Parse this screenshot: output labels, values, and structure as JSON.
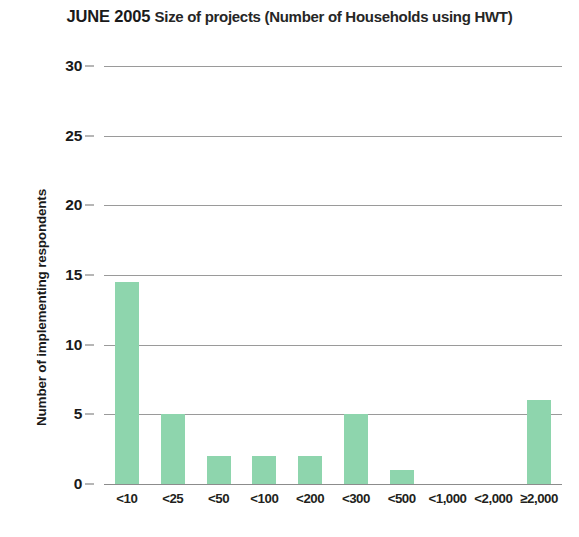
{
  "chart_data": {
    "type": "bar",
    "title": "JUNE 2005 Size of projects (Number of Households using HWT)",
    "title_bold_prefix": "JUNE 2005",
    "title_rest": "Size of projects (Number of Households using HWT)",
    "xlabel": "",
    "ylabel": "Number of implementing respondents",
    "categories": [
      "<10",
      "<25",
      "<50",
      "<100",
      "<200",
      "<300",
      "<500",
      "<1,000",
      "<2,000",
      "≥2,000"
    ],
    "values": [
      14.5,
      5,
      2,
      2,
      2,
      5,
      1,
      0,
      0,
      6
    ],
    "ylim": [
      0,
      30
    ],
    "ytick_labels": [
      "30",
      "25",
      "20",
      "15",
      "10",
      "5",
      "0"
    ],
    "ytick_values": [
      30,
      25,
      20,
      15,
      10,
      5,
      0
    ],
    "grid": "horizontal",
    "legend": "none",
    "bar_color": "#8ED5AD",
    "gridline_color": "#9A9A9A",
    "text_color": "#231F20",
    "background_color": "#FFFFFF"
  }
}
